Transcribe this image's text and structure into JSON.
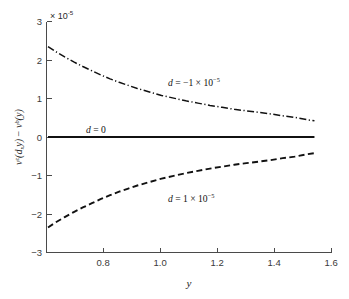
{
  "chart_data": {
    "type": "line",
    "title": "",
    "xlabel": "y",
    "ylabel": "v^z(d,y) − v^b(y)",
    "ylabel_parts": {
      "v1": "v",
      "sup1": "z",
      "arg1": "(d,y)",
      "minus": " − ",
      "v2": "v",
      "sup2": "b",
      "arg2": "(y)"
    },
    "y_multiplier": "× 10",
    "y_multiplier_exponent": "-5",
    "xlim": [
      0.66,
      1.6
    ],
    "ylim": [
      -3,
      3
    ],
    "xticks": [
      0.8,
      1.0,
      1.2,
      1.4,
      1.6
    ],
    "xtick_labels": [
      "0.8",
      "1.0",
      "1.2",
      "1.4",
      "1.6"
    ],
    "yticks": [
      -3,
      -2,
      -1,
      0,
      1,
      2,
      3
    ],
    "ytick_labels": [
      "−3",
      "−2",
      "−1",
      "0",
      "1",
      "2",
      "3"
    ],
    "grid": false,
    "legend": "none",
    "spines": [
      "left",
      "bottom"
    ],
    "series": [
      {
        "name": "d = -1 x 10^-5",
        "label_parts": {
          "d": "d",
          "eq": " = ",
          "value": "−1 × 10",
          "exponent": "−5"
        },
        "style": "dash-dot",
        "color": "#111111",
        "x": [
          0.665,
          0.69,
          0.72,
          0.75,
          0.78,
          0.81,
          0.84,
          0.87,
          0.9,
          0.93,
          0.96,
          1.0,
          1.04,
          1.08,
          1.12,
          1.16,
          1.2,
          1.24,
          1.28,
          1.32,
          1.36,
          1.4,
          1.44,
          1.48,
          1.52,
          1.545
        ],
        "y": [
          2.35,
          2.22,
          2.08,
          1.95,
          1.83,
          1.72,
          1.61,
          1.51,
          1.42,
          1.34,
          1.26,
          1.17,
          1.08,
          1.01,
          0.94,
          0.88,
          0.82,
          0.77,
          0.72,
          0.68,
          0.64,
          0.6,
          0.55,
          0.51,
          0.45,
          0.42
        ]
      },
      {
        "name": "d = 0",
        "label_parts": {
          "d": "d",
          "eq": " = ",
          "value": "0",
          "exponent": ""
        },
        "style": "solid",
        "color": "#111111",
        "x": [
          0.665,
          1.545
        ],
        "y": [
          0,
          0
        ]
      },
      {
        "name": "d = 1 x 10^-5",
        "label_parts": {
          "d": "d",
          "eq": " = ",
          "value": "1 × 10",
          "exponent": "−5"
        },
        "style": "dashed",
        "color": "#111111",
        "x": [
          0.665,
          0.69,
          0.72,
          0.75,
          0.78,
          0.81,
          0.84,
          0.87,
          0.9,
          0.93,
          0.96,
          1.0,
          1.04,
          1.08,
          1.12,
          1.16,
          1.2,
          1.24,
          1.28,
          1.32,
          1.36,
          1.4,
          1.44,
          1.48,
          1.52,
          1.545
        ],
        "y": [
          -2.35,
          -2.22,
          -2.08,
          -1.95,
          -1.83,
          -1.72,
          -1.61,
          -1.51,
          -1.42,
          -1.34,
          -1.26,
          -1.17,
          -1.08,
          -1.01,
          -0.94,
          -0.88,
          -0.82,
          -0.77,
          -0.72,
          -0.68,
          -0.64,
          -0.6,
          -0.55,
          -0.51,
          -0.45,
          -0.42
        ]
      }
    ],
    "annotations": [
      {
        "text": "d = −1 × 10⁻⁵",
        "x": 1.05,
        "y": 1.55
      },
      {
        "text": "d = 0",
        "x": 0.8,
        "y": 0.42
      },
      {
        "text": "d = 1 × 10⁻⁵",
        "x": 1.05,
        "y": -1.35
      }
    ]
  }
}
